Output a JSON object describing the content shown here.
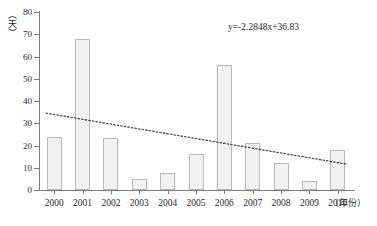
{
  "chart_data": {
    "type": "bar",
    "title": "",
    "subtitle": "",
    "xlabel": "（年份）",
    "ylabel": "（天）",
    "categories": [
      "2000",
      "2001",
      "2002",
      "2003",
      "2004",
      "2005",
      "2006",
      "2007",
      "2008",
      "2009",
      "2010"
    ],
    "values": [
      24,
      68,
      23.5,
      5,
      7.5,
      16,
      56,
      21,
      12,
      4,
      18
    ],
    "series": [
      {
        "name": "",
        "values": [
          24,
          68,
          23.5,
          5,
          7.5,
          16,
          56,
          21,
          12,
          4,
          18
        ]
      }
    ],
    "ylim": [
      0,
      80
    ],
    "y_ticks": [
      "0",
      "10",
      "20",
      "30",
      "40",
      "50",
      "60",
      "70",
      "80"
    ],
    "y_tick_values": [
      0,
      10,
      20,
      30,
      40,
      50,
      60,
      70,
      80
    ],
    "grid": false,
    "legend": false,
    "legend_position": "none",
    "annotations": [
      {
        "name": "trendline-equation",
        "text": "y=-2.2848x+36.83"
      }
    ],
    "trendline": {
      "type": "linear-dotted",
      "equation": "y=-2.2848x+36.83",
      "slope": -2.2848,
      "intercept": 36.83,
      "x_start_index": 1,
      "x_end_index": 11,
      "y_start": 34.55,
      "y_end": 11.7
    },
    "bar_style": {
      "fill": "#f2f2f2",
      "stroke": "#b9b9b9"
    },
    "axis_color": "#7d7d7d",
    "text_color": "#2b2b2b"
  }
}
